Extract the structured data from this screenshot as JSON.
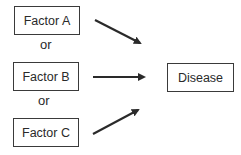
{
  "diagram": {
    "factors": [
      {
        "label": "Factor A"
      },
      {
        "label": "Factor B"
      },
      {
        "label": "Factor C"
      }
    ],
    "connectors": [
      "or",
      "or"
    ],
    "outcome": {
      "label": "Disease"
    },
    "colors": {
      "line": "#2a2a2a",
      "background": "#ffffff"
    }
  }
}
